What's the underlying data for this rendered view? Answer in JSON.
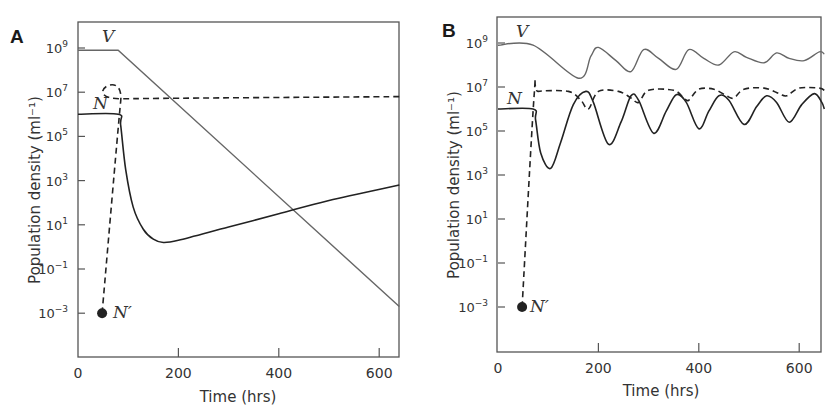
{
  "chart_data": [
    {
      "panel": "A",
      "type": "line",
      "title": "",
      "xlabel": "Time (hrs)",
      "ylabel": "Population density (ml⁻¹)",
      "yscale": "log",
      "xlim": [
        0,
        640
      ],
      "ylim_log10": [
        -4.5,
        10
      ],
      "xticks": [
        0,
        200,
        400,
        600
      ],
      "yticks_labels": [
        "10^9",
        "10^7",
        "10^5",
        "10^3",
        "10^1",
        "10^-1",
        "10^-3"
      ],
      "yticks_log10": [
        9,
        7,
        5,
        3,
        1,
        -1,
        -3
      ],
      "grid": false,
      "series": [
        {
          "name": "V",
          "style": "solid",
          "color": "#666666",
          "x": [
            0,
            80,
            640
          ],
          "log10_y": [
            8.9,
            8.9,
            -2.7
          ]
        },
        {
          "name": "N",
          "style": "solid",
          "color": "#222222",
          "x": [
            0,
            80,
            85,
            95,
            110,
            130,
            150,
            170,
            200,
            300,
            400,
            500,
            640
          ],
          "log10_y": [
            6.0,
            6.0,
            5.5,
            3.5,
            1.8,
            0.8,
            0.35,
            0.2,
            0.3,
            0.9,
            1.5,
            2.1,
            2.8
          ]
        },
        {
          "name": "N'",
          "style": "dashed",
          "color": "#222222",
          "x": [
            48,
            85,
            90,
            640
          ],
          "log10_y": [
            -3.0,
            6.6,
            6.7,
            6.8
          ],
          "marker_start": {
            "x": 48,
            "log10_y": -3.0,
            "label": "N′"
          }
        }
      ]
    },
    {
      "panel": "B",
      "type": "line",
      "title": "",
      "xlabel": "Time (hrs)",
      "ylabel": "Population density (ml⁻¹)",
      "yscale": "log",
      "xlim": [
        0,
        650
      ],
      "ylim_log10": [
        -4.5,
        10.2
      ],
      "xticks": [
        0,
        200,
        400,
        600
      ],
      "yticks_labels": [
        "10^9",
        "10^7",
        "10^5",
        "10^3",
        "10^1",
        "10^-1",
        "10^-3"
      ],
      "yticks_log10": [
        9,
        7,
        5,
        3,
        1,
        -1,
        -3
      ],
      "grid": false,
      "series": [
        {
          "name": "V",
          "style": "solid",
          "color": "#666666",
          "x": [
            0,
            70,
            160,
            185,
            200,
            235,
            265,
            290,
            320,
            355,
            380,
            410,
            440,
            470,
            495,
            530,
            555,
            580,
            610,
            640,
            650
          ],
          "log10_y": [
            8.9,
            8.9,
            7.4,
            8.4,
            8.8,
            8.2,
            7.7,
            8.7,
            8.3,
            7.8,
            8.7,
            8.3,
            8.0,
            8.6,
            8.35,
            8.1,
            8.55,
            8.3,
            8.2,
            8.6,
            8.5
          ]
        },
        {
          "name": "N",
          "style": "solid",
          "color": "#222222",
          "x": [
            0,
            70,
            75,
            85,
            105,
            125,
            150,
            175,
            190,
            220,
            245,
            265,
            280,
            310,
            335,
            355,
            375,
            400,
            420,
            440,
            460,
            490,
            515,
            535,
            555,
            580,
            605,
            630,
            645,
            650
          ],
          "log10_y": [
            6.0,
            6.0,
            5.5,
            4.0,
            3.3,
            4.5,
            6.2,
            6.8,
            6.3,
            4.4,
            5.4,
            6.6,
            6.4,
            4.9,
            5.9,
            6.65,
            6.3,
            5.1,
            5.9,
            6.6,
            6.4,
            5.3,
            6.1,
            6.6,
            6.3,
            5.4,
            6.2,
            6.7,
            6.3,
            6.0
          ]
        },
        {
          "name": "N'",
          "style": "dashed",
          "color": "#222222",
          "x": [
            48,
            72,
            80,
            140,
            165,
            180,
            200,
            240,
            265,
            280,
            300,
            350,
            370,
            380,
            400,
            430,
            455,
            470,
            490,
            530,
            560,
            575,
            600,
            640,
            650
          ],
          "log10_y": [
            -3.0,
            6.6,
            6.8,
            6.8,
            6.4,
            6.0,
            6.8,
            6.8,
            6.5,
            6.3,
            6.85,
            6.85,
            6.5,
            6.4,
            6.9,
            6.9,
            6.6,
            6.5,
            6.9,
            6.95,
            6.7,
            6.6,
            6.95,
            6.95,
            6.85
          ],
          "marker_start": {
            "x": 48,
            "log10_y": -3.0,
            "label": "N′"
          }
        }
      ]
    }
  ],
  "panels": [
    {
      "letter": "A",
      "xlabel": "Time (hrs)",
      "ylabel": "Population density (ml⁻¹)",
      "x_tick_labels": [
        "0",
        "200",
        "400",
        "600"
      ],
      "y_tick_bases": [
        "10",
        "10",
        "10",
        "10",
        "10",
        "10",
        "10"
      ],
      "y_tick_exps": [
        "9",
        "7",
        "5",
        "3",
        "1",
        "−1",
        "−3"
      ],
      "labels": {
        "V": "V",
        "N": "N",
        "Nprime": "N′"
      }
    },
    {
      "letter": "B",
      "xlabel": "Time (hrs)",
      "ylabel": "Population density (ml⁻¹)",
      "x_tick_labels": [
        "0",
        "200",
        "400",
        "600"
      ],
      "y_tick_bases": [
        "10",
        "10",
        "10",
        "10",
        "10",
        "10",
        "10"
      ],
      "y_tick_exps": [
        "9",
        "7",
        "5",
        "3",
        "1",
        "−1",
        "−3"
      ],
      "labels": {
        "V": "V",
        "N": "N",
        "Nprime": "N′"
      }
    }
  ]
}
